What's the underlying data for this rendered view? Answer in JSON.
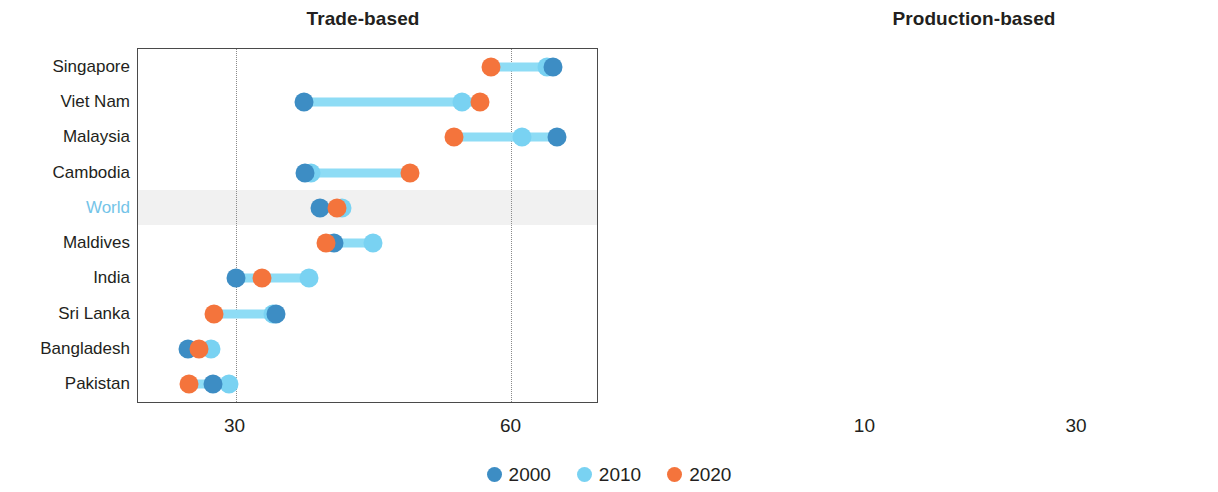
{
  "charts": [
    {
      "id": "trade-based",
      "title": "Trade-based",
      "scale": "linear",
      "xmin": 19.4,
      "xmax": 69.3,
      "ticks": [
        {
          "value": 30,
          "label": "30"
        },
        {
          "value": 60,
          "label": "60"
        }
      ],
      "highlight_row": "World",
      "rows": [
        {
          "label": "Singapore",
          "v2000": 64.5,
          "v2010": 63.9,
          "v2020": 57.8
        },
        {
          "label": "Viet Nam",
          "v2000": 37.4,
          "v2010": 54.6,
          "v2020": 56.6
        },
        {
          "label": "Malaysia",
          "v2000": 64.9,
          "v2010": 61.2,
          "v2020": 53.8
        },
        {
          "label": "Cambodia",
          "v2000": 37.6,
          "v2010": 38.2,
          "v2020": 49.0
        },
        {
          "label": "World",
          "v2000": 39.2,
          "v2010": 41.6,
          "v2020": 41.0
        },
        {
          "label": "Maldives",
          "v2000": 40.7,
          "v2010": 45.0,
          "v2020": 39.8
        },
        {
          "label": "India",
          "v2000": 30.1,
          "v2010": 38.0,
          "v2020": 32.9
        },
        {
          "label": "Sri Lanka",
          "v2000": 34.4,
          "v2010": 34.1,
          "v2020": 27.7
        },
        {
          "label": "Bangladesh",
          "v2000": 24.8,
          "v2010": 27.3,
          "v2020": 26.0
        },
        {
          "label": "Pakistan",
          "v2000": 27.5,
          "v2010": 29.3,
          "v2020": 24.9
        }
      ]
    },
    {
      "id": "production-based",
      "title": "Production-based",
      "scale": "log",
      "xmin": 6.0,
      "xmax": 62.0,
      "ticks": [
        {
          "value": 10,
          "label": "10"
        },
        {
          "value": 30,
          "label": "30"
        }
      ],
      "highlight_row": "World",
      "rows": [
        {
          "label": "Singapore",
          "v2000": 47.0,
          "v2010": 55.0,
          "v2020": 51.0
        },
        {
          "label": "Malaysia",
          "v2000": 45.0,
          "v2010": 32.5,
          "v2020": 30.5
        },
        {
          "label": "Maldives",
          "v2000": 34.5,
          "v2010": 29.0,
          "v2020": 22.5
        },
        {
          "label": "Cambodia",
          "v2000": 8.7,
          "v2010": 9.6,
          "v2020": 21.0
        },
        {
          "label": "Viet Nam",
          "v2000": 15.0,
          "v2010": 16.3,
          "v2020": 16.6
        },
        {
          "label": "World",
          "v2000": 10.0,
          "v2010": 11.2,
          "v2020": 10.6
        },
        {
          "label": "India",
          "v2000": 8.9,
          "v2010": 10.0,
          "v2020": 9.6
        },
        {
          "label": "Sri Lanka",
          "v2000": 16.4,
          "v2010": 8.4,
          "v2020": 7.7
        },
        {
          "label": "Pakistan",
          "v2000": 8.3,
          "v2010": 8.5,
          "v2020": 7.5
        },
        {
          "label": "Bangladesh",
          "v2000": 6.9,
          "v2010": 7.4,
          "v2020": 6.7
        }
      ]
    }
  ],
  "legend": {
    "items": [
      {
        "label": "2000",
        "color": "#3d8dc4"
      },
      {
        "label": "2010",
        "color": "#79d2f2"
      },
      {
        "label": "2020",
        "color": "#f4743c"
      }
    ]
  },
  "chart_data": {
    "type": "scatter",
    "subtype": "dumbbell",
    "panels": [
      "Trade-based",
      "Production-based"
    ],
    "series": [
      {
        "name": "2000",
        "color": "#3d8dc4"
      },
      {
        "name": "2010",
        "color": "#79d2f2"
      },
      {
        "name": "2020",
        "color": "#f4743c"
      }
    ],
    "legend_position": "bottom-center",
    "grid": true,
    "trade_based": {
      "xlabel": "",
      "ylabel": "",
      "scale": "linear",
      "xlim": [
        19.4,
        69.3
      ],
      "xticks": [
        30,
        60
      ],
      "categories": [
        "Singapore",
        "Viet Nam",
        "Malaysia",
        "Cambodia",
        "World",
        "Maldives",
        "India",
        "Sri Lanka",
        "Bangladesh",
        "Pakistan"
      ],
      "series": [
        {
          "name": "2000",
          "values": [
            64.5,
            37.4,
            64.9,
            37.6,
            39.2,
            40.7,
            30.1,
            34.4,
            24.8,
            27.5
          ]
        },
        {
          "name": "2010",
          "values": [
            63.9,
            54.6,
            61.2,
            38.2,
            41.6,
            45.0,
            38.0,
            34.1,
            27.3,
            29.3
          ]
        },
        {
          "name": "2020",
          "values": [
            57.8,
            56.6,
            53.8,
            49.0,
            41.0,
            39.8,
            32.9,
            27.7,
            26.0,
            24.9
          ]
        }
      ]
    },
    "production_based": {
      "xlabel": "",
      "ylabel": "",
      "scale": "log",
      "xlim": [
        6.0,
        62.0
      ],
      "xticks": [
        10,
        30
      ],
      "categories": [
        "Singapore",
        "Malaysia",
        "Maldives",
        "Cambodia",
        "Viet Nam",
        "World",
        "India",
        "Sri Lanka",
        "Pakistan",
        "Bangladesh"
      ],
      "series": [
        {
          "name": "2000",
          "values": [
            47.0,
            45.0,
            34.5,
            8.7,
            15.0,
            10.0,
            8.9,
            16.4,
            8.3,
            6.9
          ]
        },
        {
          "name": "2010",
          "values": [
            55.0,
            32.5,
            29.0,
            9.6,
            16.3,
            11.2,
            10.0,
            8.4,
            8.5,
            7.4
          ]
        },
        {
          "name": "2020",
          "values": [
            51.0,
            30.5,
            22.5,
            21.0,
            16.6,
            10.6,
            9.6,
            7.7,
            7.5,
            6.7
          ]
        }
      ]
    }
  }
}
